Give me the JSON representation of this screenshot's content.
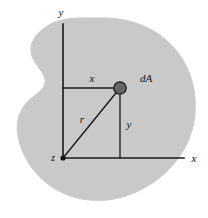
{
  "figure": {
    "background_color": "#ffffff",
    "region": {
      "name": "irregular-area",
      "fill_color": "#c9c9c9",
      "edge_color": "#c9c9c9"
    },
    "axes": {
      "line_color": "#1a1a1a",
      "origin_label": "z",
      "vertical_axis_label": "y",
      "horizontal_axis_label": "x",
      "origin_px": {
        "x": 63,
        "y": 158
      },
      "vertical_axis_top_px": {
        "x": 63,
        "y": 24
      },
      "horizontal_axis_right_px": {
        "x": 184,
        "y": 158
      }
    },
    "element": {
      "name": "dA",
      "label": "dA",
      "marker": "hatched-circle",
      "marker_color": "#2b2b2b",
      "position_px": {
        "x": 120,
        "y": 88
      }
    },
    "dimensions": [
      {
        "name": "x-distance",
        "label": "x",
        "orientation": "horizontal"
      },
      {
        "name": "y-distance",
        "label": "y",
        "orientation": "vertical"
      },
      {
        "name": "radial-distance",
        "label": "r",
        "orientation": "diagonal"
      }
    ],
    "labels": {
      "axis_y": "y",
      "axis_x": "x",
      "origin_z": "z",
      "dim_x": "x",
      "dim_y": "y",
      "dim_r": "r",
      "area_element": "dA"
    }
  }
}
